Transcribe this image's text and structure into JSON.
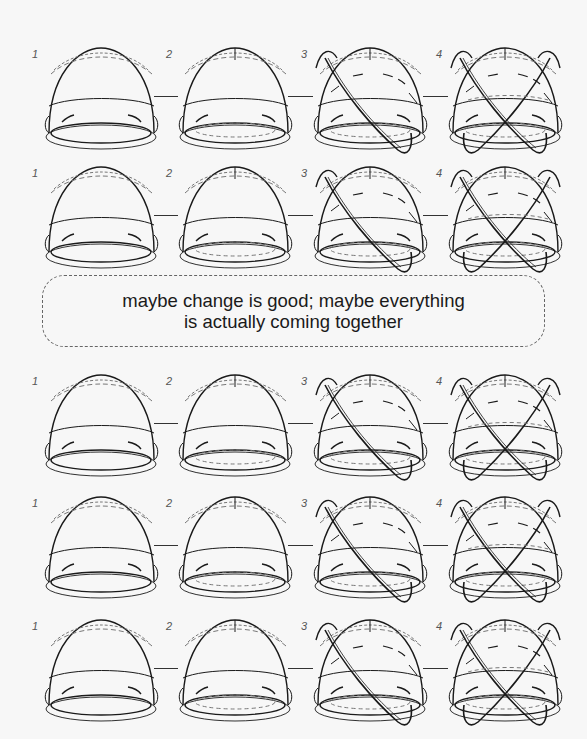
{
  "colors": {
    "background": "#f7f7f7",
    "stroke": "#1a1a1a",
    "dashed": "#777777"
  },
  "caption": {
    "line1": "maybe change is good; maybe everything",
    "line2": "is actually coming together"
  },
  "stage_labels": [
    "1",
    "2",
    "3",
    "4"
  ],
  "rows": [
    {
      "top": 48,
      "stages": [
        {
          "label": "1",
          "variant": 1
        },
        {
          "label": "2",
          "variant": 2
        },
        {
          "label": "3",
          "variant": 3
        },
        {
          "label": "4",
          "variant": 4
        }
      ]
    },
    {
      "top": 167,
      "stages": [
        {
          "label": "1",
          "variant": 1
        },
        {
          "label": "2",
          "variant": 2
        },
        {
          "label": "3",
          "variant": 3
        },
        {
          "label": "4",
          "variant": 4
        }
      ]
    },
    {
      "top": 375,
      "stages": [
        {
          "label": "1",
          "variant": 1
        },
        {
          "label": "2",
          "variant": 2
        },
        {
          "label": "3",
          "variant": 3
        },
        {
          "label": "4",
          "variant": 4
        }
      ]
    },
    {
      "top": 497,
      "stages": [
        {
          "label": "1",
          "variant": 1
        },
        {
          "label": "2",
          "variant": 2
        },
        {
          "label": "3",
          "variant": 3
        },
        {
          "label": "4",
          "variant": 4
        }
      ]
    },
    {
      "top": 620,
      "stages": [
        {
          "label": "1",
          "variant": 1
        },
        {
          "label": "2",
          "variant": 2
        },
        {
          "label": "3",
          "variant": 3
        },
        {
          "label": "4",
          "variant": 4
        }
      ]
    }
  ],
  "stage_x": [
    36,
    170,
    305,
    440
  ]
}
